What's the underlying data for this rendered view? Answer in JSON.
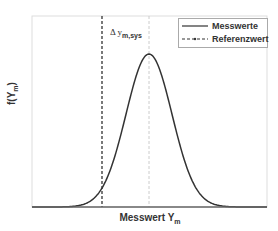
{
  "chart_data": {
    "type": "line",
    "title": "",
    "xlabel": "Messwert Y_m",
    "ylabel": "f(Y_m)",
    "x_ticks": [],
    "y_ticks": [],
    "grid": false,
    "legend_position": "top-right",
    "series": [
      {
        "name": "Messwerte",
        "style": "solid",
        "color": "#333333",
        "distribution": "normal",
        "mean_relative": 0.5,
        "description": "Gaussian probability density of measured values, peak at center of measured distribution"
      },
      {
        "name": "Referenzwert",
        "style": "dashed",
        "color": "#333333",
        "position": "vertical line left of the mean, approx. 2 standard deviations below mean"
      }
    ],
    "annotations": [
      {
        "text": "Δ y_m,sys",
        "meaning": "systematic measurement deviation between reference value and mean of measurements"
      }
    ],
    "mean_marker": {
      "style": "light dashed vertical line at mean of Messwerte"
    }
  },
  "labels": {
    "x_main": "Messwert Y",
    "x_sub": "m",
    "y_main": "f(Y",
    "y_sub": "m",
    "y_close": ")",
    "annot_delta": "Δ y",
    "annot_sub": "m,sys"
  },
  "legend": {
    "items": [
      {
        "label": "Messwerte",
        "style": "solid"
      },
      {
        "label": "Referenzwert",
        "style": "dashed"
      }
    ]
  },
  "colors": {
    "curve": "#333333",
    "reference_line": "#333333",
    "mean_line": "#cccccc",
    "frame": "#dddddd"
  },
  "geometry": {
    "frame": {
      "x0": 32,
      "y0": 16,
      "x1": 267,
      "y1": 207
    },
    "mean_px": 149,
    "sigma_px": 23,
    "peak_px": 54,
    "ref_px": 102
  }
}
